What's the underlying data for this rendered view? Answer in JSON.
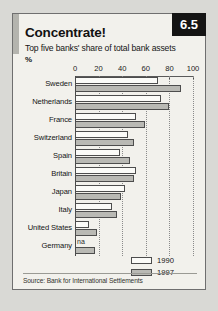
{
  "card": {
    "number_badge": "6.5",
    "title": "Concentrate!",
    "subtitle": "Top five banks' share of total bank assets",
    "unit": "%",
    "source": "Source: Bank for International Settlements"
  },
  "legend": {
    "items": [
      {
        "label": "1990",
        "color": "#fbfbf8"
      },
      {
        "label": "1997",
        "color": "#b9b9b4"
      }
    ]
  },
  "chart_data": {
    "type": "bar",
    "orientation": "horizontal",
    "title": "Concentrate!",
    "subtitle": "Top five banks' share of total bank assets",
    "xlabel": "%",
    "ylabel": "",
    "xlim": [
      0,
      100
    ],
    "xticks": [
      0,
      20,
      40,
      60,
      80,
      100
    ],
    "xticklabels": [
      "0",
      "20",
      "40",
      "60",
      "80",
      "100"
    ],
    "grid": true,
    "legend_position": "bottom-right",
    "categories": [
      "Sweden",
      "Netherlands",
      "France",
      "Switzerland",
      "Spain",
      "Britain",
      "Japan",
      "Italy",
      "United States",
      "Germany"
    ],
    "series": [
      {
        "name": "1990",
        "values": [
          70,
          73,
          52,
          45,
          38,
          52,
          42,
          31,
          12,
          null
        ]
      },
      {
        "name": "1997",
        "values": [
          90,
          80,
          59,
          50,
          47,
          50,
          39,
          36,
          19,
          17
        ]
      }
    ],
    "annotations": [
      {
        "category": "Germany",
        "series": "1990",
        "text": "na"
      }
    ]
  }
}
